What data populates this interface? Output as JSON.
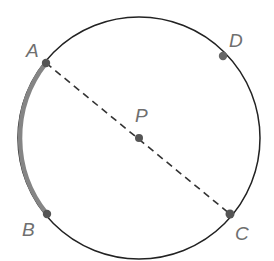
{
  "diagram": {
    "type": "circle-geometry",
    "circle": {
      "center": "P",
      "cx": 139,
      "cy": 138,
      "r": 121,
      "stroke": "#222222"
    },
    "points": [
      {
        "id": "A",
        "label": "A",
        "x": 46,
        "y": 63,
        "label_x": 26,
        "label_y": 57
      },
      {
        "id": "B",
        "label": "B",
        "x": 47,
        "y": 214,
        "label_x": 22,
        "label_y": 236
      },
      {
        "id": "C",
        "label": "C",
        "x": 230,
        "y": 214,
        "label_x": 235,
        "label_y": 240
      },
      {
        "id": "D",
        "label": "D",
        "x": 223,
        "y": 56,
        "label_x": 229,
        "label_y": 47
      },
      {
        "id": "P",
        "label": "P",
        "x": 139,
        "y": 138,
        "label_x": 135,
        "label_y": 122
      }
    ],
    "segments": [
      {
        "from": "A",
        "to": "C",
        "style": "dashed",
        "description": "diameter AC through P"
      }
    ],
    "highlighted_arcs": [
      {
        "from": "A",
        "to": "B",
        "color": "#808080",
        "description": "minor arc AB"
      }
    ],
    "point_color": "#555555"
  }
}
